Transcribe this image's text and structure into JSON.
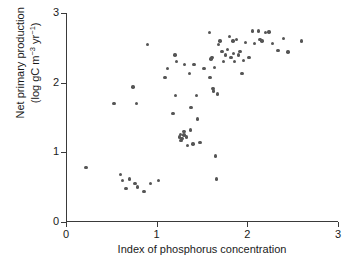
{
  "chart_data": {
    "type": "scatter",
    "title": "",
    "xlabel": "Index of phosphorus concentration",
    "ylabel_line1": "Net primary production",
    "ylabel_line2": "(log gC m−3 yr−1)",
    "ylabel_plain": "Net primary production (log gC m-3 yr-1)",
    "xlim": [
      0,
      3
    ],
    "ylim": [
      0,
      3
    ],
    "xticks": [
      "0",
      "1",
      "2",
      "3"
    ],
    "ytickvals": [
      0,
      1,
      2,
      3
    ],
    "yticks": [
      "0",
      "1",
      "2",
      "3"
    ],
    "grid": false,
    "legend": false,
    "marker_color": "#555555",
    "axis_color": "#3a3a3a",
    "background": "#ffffff",
    "n_points": 78,
    "points": [
      [
        0.22,
        0.78
      ],
      [
        0.53,
        1.7
      ],
      [
        0.6,
        0.68
      ],
      [
        0.62,
        0.6
      ],
      [
        0.66,
        0.48
      ],
      [
        0.7,
        0.62
      ],
      [
        0.74,
        1.94
      ],
      [
        0.76,
        0.55
      ],
      [
        0.78,
        1.7
      ],
      [
        0.79,
        0.5
      ],
      [
        0.86,
        0.44
      ],
      [
        0.9,
        2.55
      ],
      [
        0.93,
        0.55
      ],
      [
        1.02,
        0.6
      ],
      [
        1.09,
        2.07
      ],
      [
        1.12,
        2.2
      ],
      [
        1.18,
        1.56
      ],
      [
        1.2,
        2.4
      ],
      [
        1.21,
        1.82
      ],
      [
        1.22,
        2.3
      ],
      [
        1.25,
        1.22
      ],
      [
        1.26,
        1.26
      ],
      [
        1.27,
        1.17
      ],
      [
        1.3,
        1.3
      ],
      [
        1.31,
        2.26
      ],
      [
        1.33,
        1.22
      ],
      [
        1.34,
        1.1
      ],
      [
        1.36,
        2.13
      ],
      [
        1.37,
        1.32
      ],
      [
        1.38,
        1.64
      ],
      [
        1.4,
        1.12
      ],
      [
        1.41,
        2.26
      ],
      [
        1.44,
        1.82
      ],
      [
        1.45,
        1.48
      ],
      [
        1.48,
        1.14
      ],
      [
        1.52,
        2.2
      ],
      [
        1.58,
        2.72
      ],
      [
        1.59,
        2.07
      ],
      [
        1.6,
        2.34
      ],
      [
        1.61,
        2.36
      ],
      [
        1.62,
        1.92
      ],
      [
        1.63,
        1.88
      ],
      [
        1.64,
        2.22
      ],
      [
        1.65,
        0.95
      ],
      [
        1.66,
        0.62
      ],
      [
        1.67,
        1.84
      ],
      [
        1.68,
        2.55
      ],
      [
        1.7,
        2.6
      ],
      [
        1.72,
        2.45
      ],
      [
        1.74,
        2.3
      ],
      [
        1.76,
        2.4
      ],
      [
        1.78,
        2.48
      ],
      [
        1.8,
        2.66
      ],
      [
        1.82,
        2.36
      ],
      [
        1.84,
        2.6
      ],
      [
        1.86,
        2.3
      ],
      [
        1.88,
        2.62
      ],
      [
        1.9,
        2.4
      ],
      [
        1.92,
        2.45
      ],
      [
        1.94,
        2.13
      ],
      [
        1.96,
        2.32
      ],
      [
        1.98,
        2.58
      ],
      [
        2.02,
        2.36
      ],
      [
        2.06,
        2.74
      ],
      [
        2.08,
        2.56
      ],
      [
        2.12,
        2.74
      ],
      [
        2.16,
        2.6
      ],
      [
        2.2,
        2.72
      ],
      [
        2.24,
        2.73
      ],
      [
        2.28,
        2.56
      ],
      [
        2.34,
        2.46
      ],
      [
        2.4,
        2.63
      ],
      [
        2.45,
        2.44
      ],
      [
        2.6,
        2.6
      ],
      [
        1.3,
        1.25
      ],
      [
        1.28,
        1.2
      ],
      [
        1.85,
        2.42
      ],
      [
        2.14,
        2.62
      ]
    ]
  }
}
